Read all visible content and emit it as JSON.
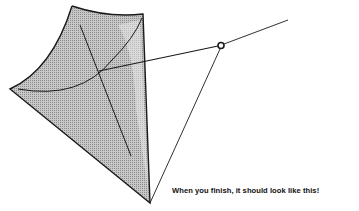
{
  "figure": {
    "caption": "When you finish, it should look like this!",
    "colors": {
      "outline": "#1a1a1a",
      "sail_fill": "#a9a9a9",
      "sail_highlight": "#e4e4e4",
      "background": "#ffffff"
    }
  }
}
